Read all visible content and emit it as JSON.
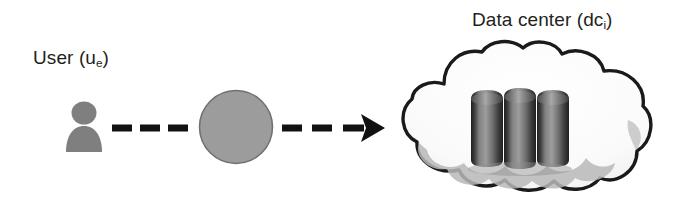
{
  "figure": {
    "type": "diagram",
    "background_color": "#ffffff",
    "width": 683,
    "height": 222
  },
  "labels": {
    "user": {
      "text": "User (u",
      "subscript": "e",
      "close": ")",
      "full": "User (ue)",
      "color": "#231f20"
    },
    "datacenter": {
      "text": "Data center (dc",
      "subscript": "i",
      "close": ")",
      "full": "Data center (dci)",
      "color": "#231f20"
    },
    "demand_node": {
      "text": "d",
      "subscript": "k",
      "full": "dk",
      "color": "#1b1b1b"
    }
  },
  "nodes": {
    "user_icon": {
      "name": "user-silhouette",
      "fill": "#7f7f7f",
      "x": 66,
      "y": 102,
      "width": 36,
      "height": 50
    },
    "demand_circle": {
      "name": "demand-circle",
      "fill": "#9c9c9c",
      "stroke": "#6f6f6f",
      "cx": 236,
      "cy": 127,
      "r": 37
    },
    "cloud": {
      "name": "cloud",
      "fill": "#fbfbfb",
      "stroke": "#1a1a1a",
      "shadow_fill": "#b9b9b9",
      "x": 403,
      "y": 46,
      "width": 250,
      "height": 152
    },
    "servers": {
      "name": "server-racks",
      "count": 3,
      "fill_dark": "#2e2e2e",
      "fill_mid": "#6d6d6d",
      "fill_light": "#9b9b9b",
      "x": 470,
      "y": 90,
      "width": 100,
      "height": 76
    }
  },
  "connectors": {
    "user_to_demand": {
      "name": "dashed-link-left",
      "style": "dashed",
      "color": "#111111",
      "dashes": 3,
      "from": "user",
      "to": "demand_circle"
    },
    "demand_to_datacenter": {
      "name": "dashed-arrow-right",
      "style": "dashed-with-arrowhead",
      "color": "#111111",
      "dashes": 2,
      "arrowhead": "solid-triangle",
      "from": "demand_circle",
      "to": "datacenter"
    }
  }
}
